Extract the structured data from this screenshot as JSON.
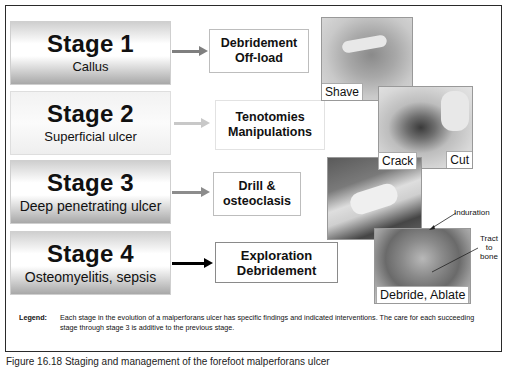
{
  "stages": [
    {
      "title": "Stage 1",
      "subtitle": "Callus",
      "action": [
        "Debridement",
        "Off-load"
      ],
      "arrow_color": "#7f7f7f"
    },
    {
      "title": "Stage 2",
      "subtitle": "Superficial ulcer",
      "action": [
        "Tenotomies",
        "Manipulations"
      ],
      "arrow_color": "#c8c8c8"
    },
    {
      "title": "Stage 3",
      "subtitle": "Deep penetrating ulcer",
      "action": [
        "Drill &",
        "osteoclasis"
      ],
      "arrow_color": "#8c8c8c"
    },
    {
      "title": "Stage 4",
      "subtitle": "Osteomyelitis, sepsis",
      "action": [
        "Exploration",
        "Debridement"
      ],
      "arrow_color": "#000000"
    }
  ],
  "photos": [
    {
      "label": "Shave"
    },
    {
      "label": "Cut"
    },
    {
      "label": "Crack"
    },
    {
      "label": "Debride, Ablate"
    }
  ],
  "annotations": {
    "induration": "Induration",
    "tract_line1": "Tract",
    "tract_line2": "to",
    "tract_line3": "bone"
  },
  "legend": {
    "label": "Legend:",
    "text": "Each stage in the evolution of a malperforans ulcer has specific findings and indicated interventions. The care for each succeeding stage through stage 3 is additive to the previous stage."
  },
  "caption": "Figure 16.18  Staging and management of the forefoot malperforans ulcer"
}
